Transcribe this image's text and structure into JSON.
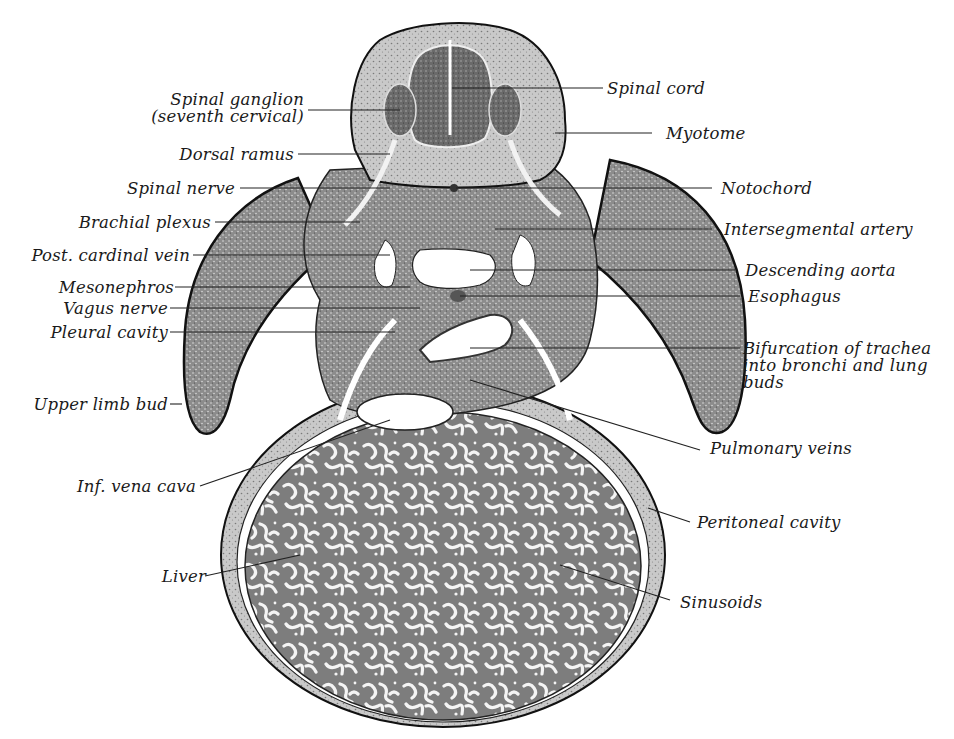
{
  "figure": {
    "colors": {
      "tissue_dark": "#6b6b6b",
      "tissue_mid": "#9a9a9a",
      "tissue_light": "#cfcfcf",
      "background": "#ffffff",
      "ink": "#1a1a1a"
    }
  },
  "labels_left": [
    {
      "id": "spinal-ganglion",
      "text": "Spinal ganglion\n(seventh cervical)"
    },
    {
      "id": "dorsal-ramus",
      "text": "Dorsal ramus"
    },
    {
      "id": "spinal-nerve",
      "text": "Spinal nerve"
    },
    {
      "id": "brachial-plexus",
      "text": "Brachial plexus"
    },
    {
      "id": "post-cardinal-vein",
      "text": "Post. cardinal vein"
    },
    {
      "id": "mesonephros",
      "text": "Mesonephros"
    },
    {
      "id": "vagus-nerve",
      "text": "Vagus nerve"
    },
    {
      "id": "pleural-cavity",
      "text": "Pleural cavity"
    },
    {
      "id": "upper-limb-bud",
      "text": "Upper limb bud"
    },
    {
      "id": "inf-vena-cava",
      "text": "Inf. vena cava"
    },
    {
      "id": "liver",
      "text": "Liver"
    }
  ],
  "labels_right": [
    {
      "id": "spinal-cord",
      "text": "Spinal cord"
    },
    {
      "id": "myotome",
      "text": "Myotome"
    },
    {
      "id": "notochord",
      "text": "Notochord"
    },
    {
      "id": "intersegmental-artery",
      "text": "Intersegmental artery"
    },
    {
      "id": "descending-aorta",
      "text": "Descending aorta"
    },
    {
      "id": "esophagus",
      "text": "Esophagus"
    },
    {
      "id": "bifurcation-trachea",
      "text": "Bifurcation of trachea\ninto bronchi and lung\nbuds"
    },
    {
      "id": "pulmonary-veins",
      "text": "Pulmonary veins"
    },
    {
      "id": "peritoneal-cavity",
      "text": "Peritoneal cavity"
    },
    {
      "id": "sinusoids",
      "text": "Sinusoids"
    }
  ]
}
